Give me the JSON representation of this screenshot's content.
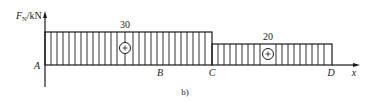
{
  "diagram": {
    "type": "axial-force-diagram",
    "caption": "b)",
    "axis": {
      "y_label_main": "F",
      "y_label_sub": "N",
      "y_label_unit": "/kN",
      "x_label": "x"
    },
    "points": [
      {
        "name": "A",
        "label": "A"
      },
      {
        "name": "B",
        "label": "B"
      },
      {
        "name": "C",
        "label": "C"
      },
      {
        "name": "D",
        "label": "D"
      }
    ],
    "segments": [
      {
        "from": "A",
        "to": "C",
        "value": 30,
        "value_label": "30",
        "sign": "+"
      },
      {
        "from": "C",
        "to": "D",
        "value": 20,
        "value_label": "20",
        "sign": "+"
      }
    ],
    "colors": {
      "line": "#1a1a1a",
      "background": "#ffffff"
    }
  }
}
